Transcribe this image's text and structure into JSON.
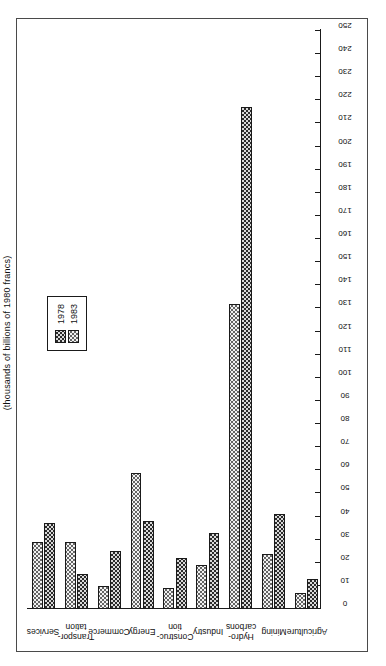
{
  "caption": "(thousands of billions of 1980 francs)",
  "legend": {
    "entries": [
      {
        "label": "1978",
        "pattern": "dark-checkerboard"
      },
      {
        "label": "1983",
        "pattern": "light-dotted"
      }
    ]
  },
  "chart_data": {
    "type": "bar",
    "orientation": "horizontal",
    "title": "(thousands of billions of 1980 francs)",
    "xlabel": "",
    "ylabel": "",
    "ylim": [
      0,
      250
    ],
    "tick_step": 10,
    "grid": false,
    "legend_position": "upper-left",
    "categories": [
      "Agriculture",
      "Mining",
      "Hydro-\ncarbons",
      "Industry",
      "Construc-\ntion",
      "Energy",
      "Commerce",
      "Transpor-\ntation",
      "Services"
    ],
    "tick_labels": [
      "0",
      "10",
      "20",
      "30",
      "40",
      "50",
      "60",
      "70",
      "80",
      "90",
      "100",
      "110",
      "120",
      "130",
      "140",
      "150",
      "160",
      "170",
      "180",
      "190",
      "200",
      "210",
      "220",
      "230",
      "240",
      "250"
    ],
    "series": [
      {
        "name": "1978",
        "values": [
          13,
          41,
          217,
          33,
          22,
          38,
          25,
          15,
          37
        ]
      },
      {
        "name": "1983",
        "values": [
          7,
          24,
          132,
          19,
          9,
          59,
          10,
          29,
          29
        ]
      }
    ]
  }
}
